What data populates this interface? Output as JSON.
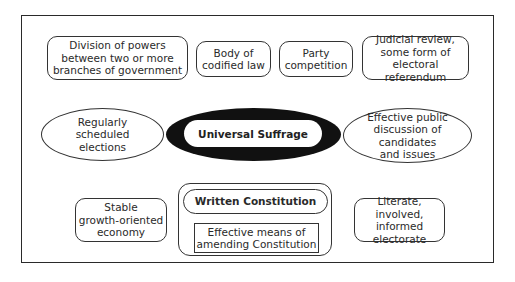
{
  "diagram": {
    "type": "concept-map",
    "center": {
      "label": "Universal Suffrage",
      "style": "bold text in white pill inside black ellipse"
    },
    "top_row": [
      {
        "label": "Division of powers\nbetween two or more\nbranches of government",
        "shape": "rounded-rect"
      },
      {
        "label": "Body of\ncodified law",
        "shape": "rounded-rect"
      },
      {
        "label": "Party\ncompetition",
        "shape": "rounded-rect"
      },
      {
        "label": "Judicial review,\nsome form of\nelectoral referendum",
        "shape": "rounded-rect"
      }
    ],
    "middle_row": {
      "left": {
        "label": "Regularly\nscheduled\nelections",
        "shape": "ellipse"
      },
      "right": {
        "label": "Effective public\ndiscussion of candidates\nand issues",
        "shape": "ellipse"
      }
    },
    "bottom_row": {
      "left": {
        "label": "Stable\ngrowth-oriented\neconomy",
        "shape": "rounded-rect"
      },
      "constitution_group": {
        "title": "Written Constitution",
        "title_shape": "pill",
        "sub": "Effective means of\namending Constitution",
        "sub_shape": "rect"
      },
      "right": {
        "label": "Literate, involved,\ninformed\nelectorate",
        "shape": "rounded-rect"
      }
    }
  },
  "colors": {
    "line": "#333333",
    "hub_fill": "#111111",
    "background": "#ffffff",
    "text": "#2a2a2a"
  }
}
